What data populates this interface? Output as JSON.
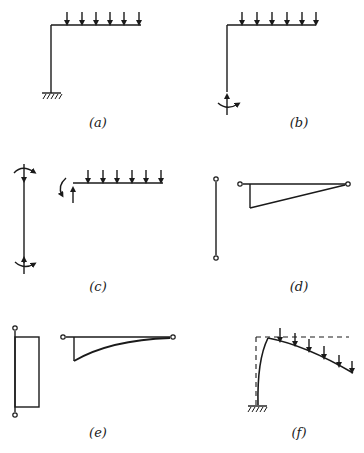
{
  "figure": {
    "panels": [
      {
        "id": "a",
        "label": "(a)",
        "description": "Fixed-base L-frame (column + cantilever beam) with uniform distributed load of 6 downward arrows on beam"
      },
      {
        "id": "b",
        "label": "(b)",
        "description": "L-frame with base support replaced by reaction forces and moment at column base"
      },
      {
        "id": "c",
        "label": "(c)",
        "description": "Free-body diagrams: column with end moments and forces; beam with end moment, upward reaction and distributed load"
      },
      {
        "id": "d",
        "label": "(d)",
        "description": "Hinged-end column and triangular (linear) moment diagram on beam"
      },
      {
        "id": "e",
        "label": "(e)",
        "description": "Rectangular (constant) moment diagram on column and parabolic moment diagram on beam"
      },
      {
        "id": "f",
        "label": "(f)",
        "description": "Deflected shape of fixed-base frame under distributed load (dashed = original geometry)"
      }
    ]
  },
  "colors": {
    "line": "#1a1a1a",
    "background": "#ffffff"
  }
}
